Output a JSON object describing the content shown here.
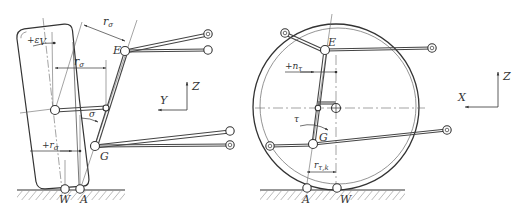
{
  "figure": {
    "colors": {
      "line": "#333333",
      "thin": "#666666",
      "background": "#ffffff"
    }
  },
  "left_view": {
    "axes": {
      "vertical": "Z",
      "horizontal": "Y"
    },
    "points": {
      "E": "E",
      "G": "G",
      "W": "W",
      "A": "A"
    },
    "labels": {
      "camber": "+ε",
      "camber_sub": "V",
      "scrub_radius_top": "r",
      "scrub_radius_top_sub": "σ",
      "kingpin_offset": "r",
      "kingpin_offset_sub": "σ",
      "kingpin_angle": "σ",
      "ground_offset": "+r",
      "ground_offset_sub": "σ"
    }
  },
  "right_view": {
    "axes": {
      "vertical": "Z",
      "horizontal": "X"
    },
    "points": {
      "E": "E",
      "G": "G",
      "W": "W",
      "A": "A"
    },
    "labels": {
      "caster_offset": "+n",
      "caster_offset_sub": "τ",
      "caster_angle": "τ",
      "caster_radius": "r",
      "caster_radius_sub": "τ,k"
    }
  }
}
